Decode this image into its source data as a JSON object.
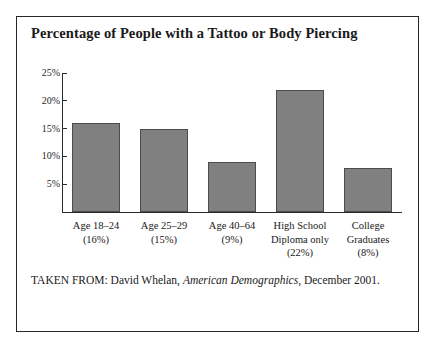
{
  "chart_data": {
    "type": "bar",
    "title": "Percentage of People with a Tattoo or Body Piercing",
    "xlabel": "",
    "ylabel": "",
    "ylim": [
      0,
      25
    ],
    "grid": false,
    "legend": null,
    "categories": [
      "Age 18–24",
      "Age 25–29",
      "Age 40–64",
      "High School Diploma only",
      "College Graduates"
    ],
    "category_lines": [
      [
        "Age 18–24"
      ],
      [
        "Age 25–29"
      ],
      [
        "Age 40–64"
      ],
      [
        "High School",
        "Diploma only"
      ],
      [
        "College",
        "Graduates"
      ]
    ],
    "values": [
      16,
      15,
      9,
      22,
      8
    ],
    "value_labels": [
      "(16%)",
      "(15%)",
      "(9%)",
      "(22%)",
      "(8%)"
    ],
    "yticks": [
      5,
      10,
      15,
      20,
      25
    ],
    "ytick_labels": [
      "5%",
      "10%",
      "15%",
      "20%",
      "25%"
    ],
    "bar_color": "#808080",
    "bar_edge_color": "#4c4c4c",
    "axis_color": "#2b2b2b"
  },
  "source": {
    "prefix": "TAKEN FROM: David Whelan,",
    "publication": "American Demographics",
    "suffix": ", December 2001."
  }
}
